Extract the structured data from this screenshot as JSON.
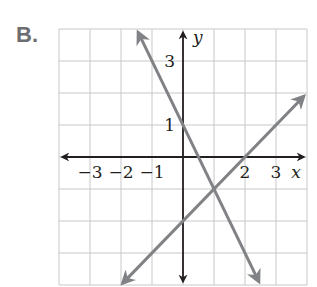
{
  "problem_label": "B.",
  "graph": {
    "grid": {
      "xmin": -4,
      "xmax": 4,
      "ymin": -4,
      "ymax": 4,
      "step": 1
    },
    "axis_labels": {
      "x": "x",
      "y": "y"
    },
    "x_ticks": [
      {
        "value": -3,
        "label": "−3"
      },
      {
        "value": -2,
        "label": "−2"
      },
      {
        "value": -1,
        "label": "−1"
      },
      {
        "value": 2,
        "label": "2"
      },
      {
        "value": 3,
        "label": "3"
      }
    ],
    "y_ticks": [
      {
        "value": 3,
        "label": "3"
      },
      {
        "value": 1,
        "label": "1"
      }
    ],
    "lines": [
      {
        "name": "decreasing-line",
        "equation": "y = -2x + 1",
        "from": [
          -1.45,
          3.9
        ],
        "to": [
          2.45,
          -3.9
        ],
        "color": "#808285"
      },
      {
        "name": "increasing-line",
        "equation": "y = x - 2",
        "from": [
          -1.95,
          -3.95
        ],
        "to": [
          3.9,
          1.9
        ],
        "color": "#808285"
      }
    ],
    "colors": {
      "grid": "#c8c8c8",
      "axis": "#231f20",
      "line": "#808285"
    }
  }
}
